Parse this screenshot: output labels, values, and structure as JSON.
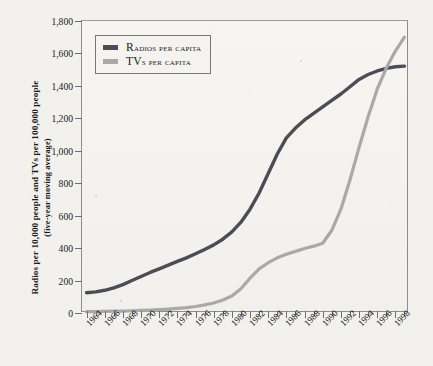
{
  "chart_data": {
    "type": "line",
    "title": "",
    "xlabel": "",
    "ylabel": "Radios per 10,000 people and TVs per 100,000 people (five-year moving average)",
    "ylabel_line1": "Radios per 10,000 people and TVs per 100,000 people",
    "ylabel_line2": "(five-year moving average)",
    "xlim": [
      1963.5,
      1999.5
    ],
    "ylim": [
      0,
      1800
    ],
    "ytick_step": 200,
    "grid": false,
    "legend_position": "top-left",
    "yticks": [
      "1,800",
      "1,600",
      "1,400",
      "1,200",
      "1,000",
      "800",
      "600",
      "400",
      "200",
      "0"
    ],
    "ytick_values": [
      1800,
      1600,
      1400,
      1200,
      1000,
      800,
      600,
      400,
      200,
      0
    ],
    "xticks_all": [
      1964,
      1965,
      1966,
      1967,
      1968,
      1969,
      1970,
      1971,
      1972,
      1973,
      1974,
      1975,
      1976,
      1977,
      1978,
      1979,
      1980,
      1981,
      1982,
      1983,
      1984,
      1985,
      1986,
      1987,
      1988,
      1989,
      1990,
      1991,
      1992,
      1993,
      1994,
      1995,
      1996,
      1997,
      1998,
      1999
    ],
    "xtick_labels": [
      "1964",
      "1966",
      "1968",
      "1970",
      "1972",
      "1974",
      "1976",
      "1978",
      "1980",
      "1982",
      "1984",
      "1986",
      "1988",
      "1990",
      "1992",
      "1994",
      "1996",
      "1998"
    ],
    "xtick_label_values": [
      1964,
      1966,
      1968,
      1970,
      1972,
      1974,
      1976,
      1978,
      1980,
      1982,
      1984,
      1986,
      1988,
      1990,
      1992,
      1994,
      1996,
      1998
    ],
    "x": [
      1964,
      1965,
      1966,
      1967,
      1968,
      1969,
      1970,
      1971,
      1972,
      1973,
      1974,
      1975,
      1976,
      1977,
      1978,
      1979,
      1980,
      1981,
      1982,
      1983,
      1984,
      1985,
      1986,
      1987,
      1988,
      1989,
      1990,
      1991,
      1992,
      1993,
      1994,
      1995,
      1996,
      1997,
      1998,
      1999
    ],
    "series": [
      {
        "name": "Radios per capita",
        "color": "#4c4c54",
        "values": [
          125,
          130,
          140,
          155,
          175,
          200,
          225,
          250,
          272,
          295,
          318,
          340,
          365,
          392,
          420,
          455,
          500,
          560,
          640,
          740,
          860,
          980,
          1080,
          1140,
          1190,
          1230,
          1270,
          1310,
          1350,
          1395,
          1440,
          1470,
          1492,
          1508,
          1518,
          1522
        ]
      },
      {
        "name": "TVs per capita",
        "color": "#a9a9a9",
        "values": [
          8,
          9,
          10,
          11,
          12,
          14,
          16,
          18,
          21,
          24,
          28,
          33,
          40,
          50,
          62,
          80,
          105,
          150,
          215,
          272,
          310,
          340,
          362,
          380,
          398,
          412,
          430,
          510,
          640,
          820,
          1020,
          1210,
          1380,
          1510,
          1615,
          1700
        ]
      }
    ],
    "legend": [
      {
        "label_first": "R",
        "label_rest": "adios per capita",
        "color": "#4c4c54"
      },
      {
        "label_first": "TV",
        "label_rest": "s per capita",
        "color": "#a9a9a9"
      }
    ]
  }
}
